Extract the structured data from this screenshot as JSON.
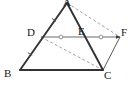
{
  "figure": {
    "width": 134,
    "height": 86,
    "background_color": "#ffffff",
    "stroke_color": "#3a3a3a",
    "dashed_color": "#8a8a8a",
    "tick_color": "#8a8a8a",
    "label_color": "#1a1a1a"
  },
  "points": {
    "A": {
      "label": "A",
      "x": 67,
      "y": 3,
      "label_x": 63,
      "label_y": -3
    },
    "B": {
      "label": "B",
      "x": 20,
      "y": 70,
      "label_x": 4,
      "label_y": 68
    },
    "C": {
      "label": "C",
      "x": 103,
      "y": 70,
      "label_x": 104,
      "label_y": 70
    },
    "D": {
      "label": "D",
      "x": 41,
      "y": 37,
      "label_x": 27,
      "label_y": 27
    },
    "E": {
      "label": "E",
      "x": 82,
      "y": 37,
      "label_x": 78,
      "label_y": 26
    },
    "F": {
      "label": "F",
      "x": 120,
      "y": 37,
      "label_x": 121,
      "label_y": 27
    }
  },
  "segments": [
    {
      "name": "AB",
      "from": "A",
      "to": "B",
      "style": "solid",
      "width": 1.9
    },
    {
      "name": "AC",
      "from": "A",
      "to": "C",
      "style": "solid",
      "width": 1.9
    },
    {
      "name": "BC",
      "from": "B",
      "to": "C",
      "style": "solid",
      "width": 1.9
    },
    {
      "name": "DF",
      "from": "D",
      "to": "F",
      "style": "solid",
      "width": 1.0,
      "arrow_at": "F"
    },
    {
      "name": "CF",
      "from": "C",
      "to": "F",
      "style": "solid",
      "width": 1.0
    },
    {
      "name": "AF",
      "from": "A",
      "to": "F",
      "style": "dashed",
      "width": 1.0
    },
    {
      "name": "DC",
      "from": "D",
      "to": "C",
      "style": "dashed",
      "width": 1.0
    }
  ],
  "tick_marks": [
    {
      "name": "tick-DE",
      "on": "DE",
      "kind": "circle",
      "x": 61,
      "y": 37
    },
    {
      "name": "tick-EF",
      "on": "EF",
      "kind": "circle",
      "x": 101,
      "y": 37
    },
    {
      "name": "tick-AD",
      "on": "AD",
      "kind": "slash",
      "x": 54,
      "y": 20
    },
    {
      "name": "tick-DB",
      "on": "DB",
      "kind": "slash",
      "x": 30,
      "y": 54
    }
  ]
}
